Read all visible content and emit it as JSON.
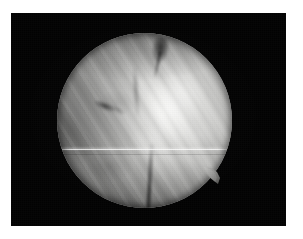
{
  "figure": {
    "kind": "endoscopic-photograph",
    "width": 303,
    "height": 239,
    "page_background": "#ffffff",
    "alt_text": "Grayscale endoscopic photograph showing a circular field of view of pale fibrous tissue on a black background"
  },
  "frame": {
    "name": "black-letterbox-frame",
    "x": 11,
    "y": 13,
    "width": 275,
    "height": 213,
    "color": "#030303"
  },
  "scope": {
    "name": "circular-field-of-view",
    "center_x": 144,
    "center_y": 120,
    "radius": 87,
    "diameter": 175,
    "tissue_color_bright": "#f2f2f0",
    "tissue_color_mid": "#b9b9b7",
    "tissue_color_dark": "#5e5e5c"
  },
  "features": {
    "notch_top": {
      "name": "dark-cleft-top",
      "description": "Dark V-shaped cleft at upper field"
    },
    "streak_left": {
      "name": "dark-streak-left",
      "description": "Dark diagonal streak left of centre"
    },
    "crease_bottom": {
      "name": "dark-crease-bottom",
      "description": "Dark vertical crease at lower centre"
    },
    "protrusion": {
      "name": "tissue-tab-lower-right",
      "description": "Small pointed tissue tab protruding at lower right of the circle",
      "x": 204,
      "y": 167,
      "width": 24,
      "height": 22
    },
    "scanline": {
      "name": "horizontal-scanline-artifact",
      "description": "Bright horizontal video interlace line across the middle of the field",
      "y": 136,
      "color": "#ffffff"
    },
    "striations": {
      "name": "diagonal-fibre-striations",
      "angle_degrees": 58,
      "description": "Diagonal fibrous striations running lower-left to upper-right"
    }
  }
}
